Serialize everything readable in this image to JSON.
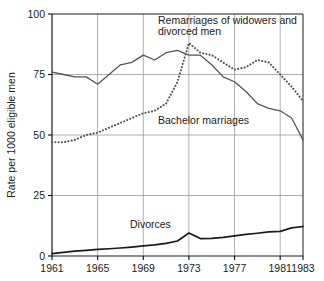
{
  "chart_data": {
    "type": "line",
    "title": "",
    "xlabel": "",
    "ylabel": "Rate per 1000 eligible men",
    "xlim": [
      1961,
      1983
    ],
    "ylim": [
      0,
      100
    ],
    "grid": true,
    "legend_position": "inline-annotations",
    "x_ticks": [
      1961,
      1965,
      1969,
      1973,
      1977,
      1981,
      1983
    ],
    "x_tick_labels": [
      "1961",
      "1965",
      "1969",
      "1973",
      "1977",
      "1981",
      "1983"
    ],
    "y_ticks": [
      0,
      25,
      50,
      75,
      100
    ],
    "y_tick_labels": [
      "0",
      "25",
      "50",
      "75",
      "100"
    ],
    "x": [
      1961,
      1962,
      1963,
      1964,
      1965,
      1966,
      1967,
      1968,
      1969,
      1970,
      1971,
      1972,
      1973,
      1974,
      1975,
      1976,
      1977,
      1978,
      1979,
      1980,
      1981,
      1982,
      1983
    ],
    "series": [
      {
        "name": "Remarriages of widowers and divorced men",
        "style": "dotted",
        "color": "#555555",
        "annotation_line1": "Remarriages of widowers and",
        "annotation_line2": "divorced men",
        "values": [
          47,
          47,
          48,
          50,
          51,
          53,
          55,
          57,
          59,
          60,
          63,
          72,
          88,
          84,
          83,
          80,
          77,
          78,
          81,
          80,
          75,
          70,
          64
        ]
      },
      {
        "name": "Bachelor marriages",
        "style": "solid",
        "color": "#555555",
        "annotation_line1": "Bachelor marriages",
        "values": [
          76,
          75,
          74,
          74,
          71,
          75,
          79,
          80,
          83,
          81,
          84,
          85,
          83,
          83,
          79,
          74,
          72,
          68,
          63,
          61,
          60,
          57,
          48
        ]
      },
      {
        "name": "Divorces",
        "style": "solid-thick",
        "color": "#1a1a1a",
        "annotation_line1": "Divorces",
        "values": [
          1,
          1.5,
          2,
          2.3,
          2.7,
          3,
          3.3,
          3.7,
          4.2,
          4.6,
          5.2,
          6.2,
          9.5,
          7.2,
          7.3,
          7.7,
          8.3,
          8.9,
          9.4,
          10,
          10.2,
          11.6,
          12.2
        ]
      }
    ],
    "annotations": [
      {
        "name": "remarriages-label",
        "text_line1": "Remarriages of widowers and",
        "text_line2": "divorced men"
      },
      {
        "name": "bachelor-label",
        "text": "Bachelor marriages"
      },
      {
        "name": "divorces-label",
        "text": "Divorces"
      }
    ]
  },
  "colors": {
    "axis": "#1a1a1a",
    "grid": "#9a9a9a",
    "line_light": "#555555",
    "line_dark": "#1a1a1a",
    "background": "#ffffff"
  }
}
